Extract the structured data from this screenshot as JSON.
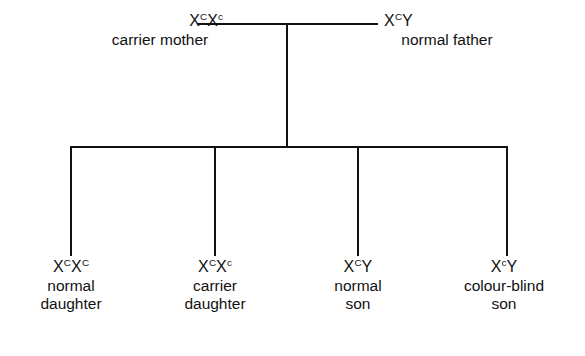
{
  "diagram": {
    "line_color": "#111111",
    "background": "#ffffff",
    "parents": {
      "mother": {
        "genotype_prefix": "X",
        "allele_1": "C",
        "genotype_middle": "X",
        "allele_2": "c",
        "label": "carrier mother"
      },
      "father": {
        "genotype_prefix": "X",
        "allele_1": "C",
        "genotype_suffix": "Y",
        "label": "normal father"
      }
    },
    "offspring": [
      {
        "genotype_prefix": "X",
        "allele_1": "C",
        "genotype_middle": "X",
        "allele_2": "C",
        "phenotype_line_1": "normal",
        "phenotype_line_2": "daughter"
      },
      {
        "genotype_prefix": "X",
        "allele_1": "C",
        "genotype_middle": "X",
        "allele_2": "c",
        "phenotype_line_1": "carrier",
        "phenotype_line_2": "daughter"
      },
      {
        "genotype_prefix": "X",
        "allele_1": "C",
        "genotype_middle": "Y",
        "allele_2": "",
        "phenotype_line_1": "normal",
        "phenotype_line_2": "son"
      },
      {
        "genotype_prefix": "X",
        "allele_1": "c",
        "genotype_middle": "Y",
        "allele_2": "",
        "phenotype_line_1": "colour-blind",
        "phenotype_line_2": "son"
      }
    ]
  }
}
